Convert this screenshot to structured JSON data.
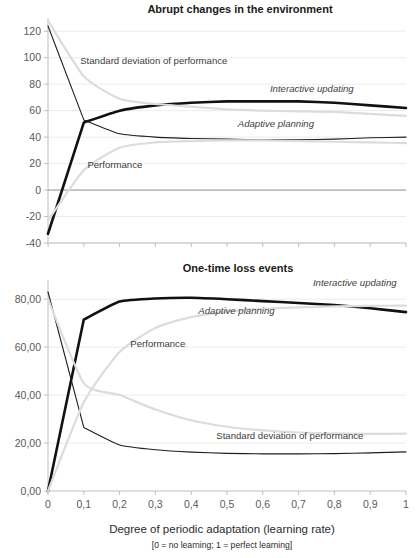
{
  "figure": {
    "xaxis_title": "Degree of periodic adaptation (learning rate)",
    "xaxis_subtitle": "[0 = no learning;  1 = perfect learning]",
    "x_tick_labels": [
      "0",
      "0,1",
      "0,2",
      "0,3",
      "0,4",
      "0,5",
      "0,6",
      "0,7",
      "0,8",
      "0,9",
      "1"
    ],
    "colors": {
      "bold_series": "#111111",
      "thin_series": "#1e1e1e",
      "pale_series": "#dcdcdc",
      "axis": "#bfbfbf",
      "grid": "#ececec",
      "zero_line": "#8c8c8c"
    }
  },
  "chart_data": [
    {
      "type": "line",
      "title": "Abrupt changes in the environment",
      "xlabel": "Degree of periodic adaptation (learning rate)",
      "ylabel": "",
      "grid": true,
      "legend": "inline-annotations",
      "x": [
        0,
        0.1,
        0.2,
        0.3,
        0.4,
        0.5,
        0.6,
        0.7,
        0.8,
        0.9,
        1
      ],
      "xlim": [
        0,
        1
      ],
      "ylim": [
        -40,
        130
      ],
      "y_tick_labels": [
        "120",
        "100",
        "80",
        "60",
        "40",
        "20",
        "0",
        "-20",
        "-40"
      ],
      "y_ticks": [
        120,
        100,
        80,
        60,
        40,
        20,
        0,
        -20,
        -40
      ],
      "series": [
        {
          "name": "Interactive updating",
          "style": "bold-black",
          "label_x": 0.62,
          "label_y": 74,
          "values": [
            -33,
            51,
            60,
            64,
            66,
            67,
            67,
            67,
            66,
            64,
            62
          ]
        },
        {
          "name": "Adaptive planning",
          "style": "thin-black",
          "label_x": 0.53,
          "label_y": 48,
          "values": [
            124,
            53,
            42.5,
            40,
            39,
            38.5,
            38,
            38,
            38.5,
            39.5,
            40
          ]
        },
        {
          "name": "Standard deviation of performance",
          "style": "pale-gray",
          "label_x": 0.09,
          "label_y": 95,
          "values": [
            128,
            86,
            69,
            65,
            63,
            61,
            60,
            59.5,
            59,
            57.5,
            56
          ]
        },
        {
          "name": "Performance",
          "style": "pale-gray",
          "label_x": 0.11,
          "label_y": 17,
          "values": [
            -23,
            15,
            32,
            36,
            37,
            37.5,
            37.5,
            37,
            36.5,
            36,
            35.5
          ]
        }
      ]
    },
    {
      "type": "line",
      "title": "One-time loss events",
      "xlabel": "Degree of periodic adaptation (learning rate)",
      "ylabel": "",
      "grid": true,
      "legend": "inline-annotations",
      "x": [
        0,
        0.1,
        0.2,
        0.3,
        0.4,
        0.5,
        0.6,
        0.7,
        0.8,
        0.9,
        1
      ],
      "xlim": [
        0,
        1
      ],
      "ylim": [
        0,
        88
      ],
      "y_tick_labels": [
        "80,00",
        "60,00",
        "40,00",
        "20,00",
        "0,00"
      ],
      "y_ticks": [
        80,
        60,
        40,
        20,
        0
      ],
      "series": [
        {
          "name": "Interactive updating",
          "style": "bold-black",
          "label_x": 0.74,
          "label_y": 85.5,
          "values": [
            0,
            71.5,
            79,
            80.3,
            80.6,
            80,
            79.2,
            78.4,
            77.6,
            76.2,
            74.6
          ]
        },
        {
          "name": "Adaptive planning",
          "style": "thin-black",
          "label_x": 0.42,
          "label_y": 74,
          "values": [
            83,
            26.5,
            19.2,
            17.2,
            16.2,
            15.7,
            15.5,
            15.5,
            15.6,
            15.9,
            16.3
          ]
        },
        {
          "name": "Performance",
          "style": "pale-gray",
          "label_x": 0.23,
          "label_y": 60,
          "values": [
            0,
            37,
            58,
            68,
            72.5,
            74.8,
            76,
            76.6,
            77,
            77.2,
            77.3
          ]
        },
        {
          "name": "Standard deviation of performance",
          "style": "pale-gray",
          "label_x": 0.47,
          "label_y": 21.5,
          "values": [
            80,
            45,
            40,
            34,
            29.5,
            26.8,
            25.3,
            24.4,
            24,
            23.8,
            23.9
          ]
        }
      ]
    }
  ]
}
